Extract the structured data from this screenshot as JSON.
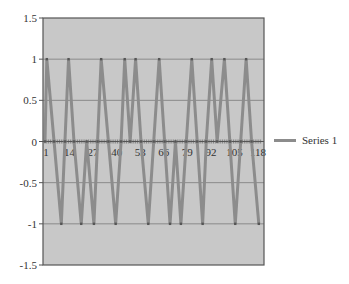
{
  "chart_data": {
    "type": "line",
    "title": "",
    "xlabel": "",
    "ylabel": "",
    "ylim": [
      -1.5,
      1.5
    ],
    "xlim": [
      1,
      120
    ],
    "grid": true,
    "legend_position": "right",
    "y_ticks": [
      "1.5",
      "1",
      "0.5",
      "0",
      "-0.5",
      "-1",
      "-1.5"
    ],
    "y_tick_values": [
      1.5,
      1,
      0.5,
      0,
      -0.5,
      -1,
      -1.5
    ],
    "x_ticks": [
      "1",
      "14",
      "27",
      "40",
      "53",
      "66",
      "79",
      "92",
      "105",
      "118"
    ],
    "x_tick_values": [
      1,
      14,
      27,
      40,
      53,
      66,
      79,
      92,
      105,
      118
    ],
    "series": [
      {
        "name": "Series 1",
        "color": "#8c8c8c",
        "x": [
          1,
          2,
          6,
          10,
          12,
          14,
          17,
          21,
          24,
          28,
          30,
          32,
          36,
          40,
          43,
          45,
          48,
          51,
          54,
          58,
          61,
          64,
          67,
          70,
          73,
          76,
          79,
          82,
          85,
          88,
          90,
          93,
          96,
          100,
          103,
          106,
          109,
          112,
          115,
          119
        ],
        "values": [
          0.0,
          1.0,
          0.0,
          -1.0,
          0.0,
          1.0,
          0.0,
          -1.0,
          0.0,
          -1.0,
          0.0,
          1.0,
          0.0,
          -1.0,
          0.0,
          1.0,
          0.0,
          1.0,
          0.0,
          -1.0,
          0.0,
          1.0,
          0.0,
          -1.0,
          0.0,
          -1.0,
          0.0,
          1.0,
          0.0,
          -1.0,
          0.0,
          1.0,
          0.0,
          1.0,
          0.0,
          -1.0,
          0.0,
          1.0,
          0.0,
          -1.0
        ]
      }
    ]
  },
  "legend": {
    "items": [
      {
        "label": "Series 1"
      }
    ]
  },
  "colors": {
    "plot_background": "#c8c8c8",
    "gridline": "#8a8a8a",
    "series": "#8c8c8c",
    "axis": "#555555"
  }
}
